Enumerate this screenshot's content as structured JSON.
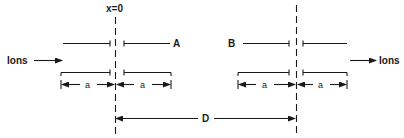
{
  "diagram": {
    "type": "electrostatic lens / aperture geometry",
    "origin_label": "x=0",
    "ion_labels": {
      "incoming": "Ions",
      "outgoing": "Ions"
    },
    "electrodes": {
      "left": {
        "label": "A"
      },
      "right": {
        "label": "B"
      }
    },
    "dimensions": {
      "half_width_label": "a",
      "separation_label": "D"
    },
    "colors": {
      "ink": "#1a1a1a",
      "background": "#ffffff"
    }
  }
}
